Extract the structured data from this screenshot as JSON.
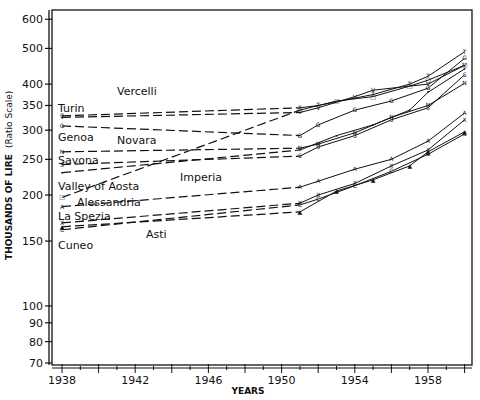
{
  "chart_data": {
    "type": "line",
    "title": "",
    "xlabel": "YEARS",
    "ylabel": "THOUSANDS OF LIRE (Ratio Scale)",
    "yscale": "log",
    "ylim": [
      70,
      620
    ],
    "xlim": [
      1937.5,
      1960.5
    ],
    "x_ticks": [
      1938,
      1942,
      1946,
      1950,
      1954,
      1958
    ],
    "y_ticks": [
      70,
      80,
      90,
      100,
      150,
      200,
      250,
      300,
      350,
      400,
      500,
      600
    ],
    "grid": false,
    "legend": "inline labels",
    "series": [
      {
        "name": "Turin",
        "marker": "T",
        "points": [
          [
            1938,
            328
          ],
          [
            1951,
            345
          ],
          [
            1952,
            350
          ],
          [
            1955,
            375
          ],
          [
            1957,
            400
          ],
          [
            1958,
            420
          ],
          [
            1960,
            490
          ]
        ]
      },
      {
        "name": "Vercelli",
        "marker": "V",
        "points": [
          [
            1938,
            325
          ],
          [
            1951,
            335
          ],
          [
            1952,
            345
          ],
          [
            1954,
            370
          ],
          [
            1955,
            385
          ],
          [
            1958,
            400
          ],
          [
            1960,
            450
          ]
        ]
      },
      {
        "name": "Genoa",
        "marker": "G",
        "points": [
          [
            1938,
            308
          ],
          [
            1951,
            290
          ],
          [
            1952,
            310
          ],
          [
            1954,
            340
          ],
          [
            1956,
            360
          ],
          [
            1958,
            390
          ],
          [
            1960,
            470
          ]
        ]
      },
      {
        "name": "Novara",
        "marker": "N",
        "points": [
          [
            1938,
            262
          ],
          [
            1951,
            268
          ],
          [
            1952,
            275
          ],
          [
            1954,
            295
          ],
          [
            1956,
            325
          ],
          [
            1958,
            350
          ],
          [
            1960,
            402
          ]
        ]
      },
      {
        "name": "Savona",
        "marker": "S",
        "points": [
          [
            1938,
            242
          ],
          [
            1951,
            255
          ],
          [
            1952,
            270
          ],
          [
            1954,
            290
          ],
          [
            1956,
            320
          ],
          [
            1958,
            345
          ],
          [
            1960,
            424
          ]
        ]
      },
      {
        "name": "Imperia",
        "marker": "•",
        "points": [
          [
            1938,
            230
          ],
          [
            1951,
            265
          ],
          [
            1953,
            290
          ],
          [
            1955,
            310
          ],
          [
            1957,
            340
          ],
          [
            1958,
            380
          ],
          [
            1960,
            440
          ]
        ]
      },
      {
        "name": "Valley of Aosta",
        "marker": "□",
        "points": [
          [
            1938,
            197
          ],
          [
            1951,
            340
          ],
          [
            1953,
            360
          ],
          [
            1955,
            370
          ],
          [
            1957,
            395
          ],
          [
            1958,
            410
          ],
          [
            1960,
            450
          ]
        ]
      },
      {
        "name": "Alessandria",
        "marker": "A",
        "points": [
          [
            1938,
            186
          ],
          [
            1951,
            210
          ],
          [
            1952,
            218
          ],
          [
            1954,
            235
          ],
          [
            1956,
            250
          ],
          [
            1958,
            280
          ],
          [
            1960,
            334
          ]
        ]
      },
      {
        "name": "La Spezia",
        "marker": "X",
        "points": [
          [
            1938,
            168
          ],
          [
            1951,
            190
          ],
          [
            1952,
            200
          ],
          [
            1954,
            215
          ],
          [
            1956,
            240
          ],
          [
            1958,
            265
          ],
          [
            1960,
            320
          ]
        ]
      },
      {
        "name": "Cuneo",
        "marker": "C",
        "points": [
          [
            1938,
            161
          ],
          [
            1951,
            188
          ],
          [
            1952,
            195
          ],
          [
            1954,
            212
          ],
          [
            1956,
            232
          ],
          [
            1958,
            258
          ],
          [
            1960,
            293
          ]
        ]
      },
      {
        "name": "Asti",
        "marker": "▲",
        "points": [
          [
            1938,
            164
          ],
          [
            1951,
            180
          ],
          [
            1953,
            205
          ],
          [
            1955,
            220
          ],
          [
            1957,
            240
          ],
          [
            1958,
            262
          ],
          [
            1960,
            297
          ]
        ]
      }
    ]
  },
  "labels": {
    "turin": "Turin",
    "vercelli": "Vercelli",
    "genoa": "Genoa",
    "novara": "Novara",
    "savona": "Savona",
    "imperia": "Imperia",
    "aosta": "Valley of Aosta",
    "alessandria": "Alessandria",
    "laspezia": "La Spezia",
    "asti": "Asti",
    "cuneo": "Cuneo"
  },
  "axes": {
    "x_title": "YEARS",
    "y_title": "THOUSANDS OF LIRE",
    "y_subtitle": "(Ratio Scale)"
  }
}
